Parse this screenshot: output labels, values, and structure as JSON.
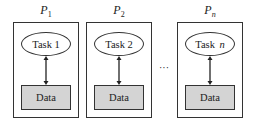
{
  "diagram": {
    "processes": [
      {
        "label": "P",
        "sub": "1",
        "task_prefix": "Task",
        "task_index": "1",
        "data": "Data"
      },
      {
        "label": "P",
        "sub": "2",
        "task_prefix": "Task",
        "task_index": "2",
        "data": "Data"
      },
      {
        "label": "P",
        "sub": "n",
        "task_prefix": "Task",
        "task_index": "n",
        "data": "Data"
      }
    ],
    "ellipsis": "···",
    "colors": {
      "stroke": "#333333",
      "data_fill": "#d4d4d4",
      "background": "#ffffff"
    }
  }
}
